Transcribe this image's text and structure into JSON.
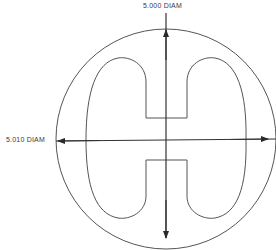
{
  "diagram": {
    "type": "engineering-drawing",
    "dimensions": {
      "vertical": {
        "label": "5.000 DIAM",
        "value": 5.0,
        "unit": "DIAM"
      },
      "horizontal": {
        "label": "5.010 DIAM",
        "value": 5.01,
        "unit": "DIAM"
      }
    },
    "colors": {
      "line": "#4a4a4a",
      "text": "#3a3a3a",
      "background": "#ffffff"
    }
  }
}
